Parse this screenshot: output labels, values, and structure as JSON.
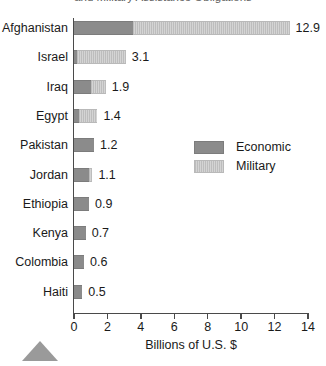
{
  "chart_data": {
    "type": "bar",
    "orientation": "horizontal",
    "stacked": true,
    "title": "and Military Assistance Obligations",
    "xlabel": "Billions of U.S. $",
    "ylabel": "",
    "xlim": [
      0,
      14
    ],
    "xticks": [
      0,
      2,
      4,
      6,
      8,
      10,
      12,
      14
    ],
    "xtick_labels": [
      "0",
      "2",
      "4",
      "6",
      "8",
      "10",
      "12",
      "14"
    ],
    "grid": false,
    "legend_position": "center-right",
    "categories": [
      "Afghanistan",
      "Israel",
      "Iraq",
      "Egypt",
      "Pakistan",
      "Jordan",
      "Ethiopia",
      "Kenya",
      "Colombia",
      "Haiti"
    ],
    "series": [
      {
        "name": "Economic",
        "color": "#8b8b8b",
        "values": [
          3.5,
          0.2,
          1.0,
          0.3,
          1.2,
          0.9,
          0.9,
          0.7,
          0.6,
          0.5
        ]
      },
      {
        "name": "Military",
        "color": "#c9c9c9",
        "values": [
          9.4,
          2.9,
          0.9,
          1.1,
          0.0,
          0.2,
          0.0,
          0.0,
          0.0,
          0.0
        ]
      }
    ],
    "totals": [
      12.9,
      3.1,
      1.9,
      1.4,
      1.2,
      1.1,
      0.9,
      0.7,
      0.6,
      0.5
    ],
    "total_labels": [
      "12.9",
      "3.1",
      "1.9",
      "1.4",
      "1.2",
      "1.1",
      "0.9",
      "0.7",
      "0.6",
      "0.5"
    ]
  },
  "legend": {
    "entries": [
      {
        "label": "Economic",
        "swatch": "economic"
      },
      {
        "label": "Military",
        "swatch": "military"
      }
    ]
  }
}
